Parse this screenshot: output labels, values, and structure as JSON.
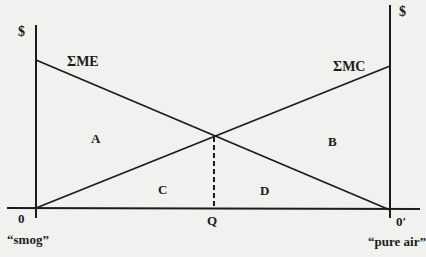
{
  "diagram": {
    "type": "marginal-analysis",
    "left_axis_label": "$",
    "right_axis_label": "$",
    "curves": {
      "marginal_external": {
        "label": "ΣME",
        "from": [
          36,
          60
        ],
        "to": [
          390,
          210
        ]
      },
      "marginal_cost": {
        "label": "ΣMC",
        "from": [
          36,
          208
        ],
        "to": [
          390,
          66
        ]
      }
    },
    "regions": {
      "A": "A",
      "B": "B",
      "C": "C",
      "D": "D"
    },
    "x_axis": {
      "origin_left": "0",
      "origin_right": "0′",
      "optimum": "Q",
      "left_end_caption": "“smog”",
      "right_end_caption": "“pure air”"
    },
    "colors": {
      "background": "#f1f1ef",
      "ink": "#1c1c1c"
    }
  }
}
